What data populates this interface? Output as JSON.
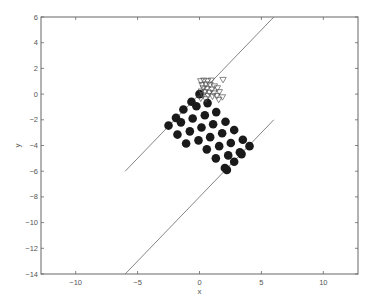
{
  "chart_data": {
    "type": "scatter",
    "title": "",
    "xlabel": "x",
    "ylabel": "y",
    "xlim": [
      -12.8,
      12.8
    ],
    "ylim": [
      -14,
      6
    ],
    "xticks": [
      -10,
      -5,
      0,
      5,
      10
    ],
    "xtick_labels": [
      "−10",
      "−5",
      "0",
      "5",
      "10"
    ],
    "yticks": [
      6,
      4,
      2,
      0,
      -2,
      -4,
      -6,
      -8,
      -10,
      -12,
      -14
    ],
    "ytick_labels": [
      "6",
      "4",
      "2",
      "0",
      "−2",
      "−4",
      "−6",
      "−8",
      "−10",
      "−12",
      "−14"
    ],
    "grid": false,
    "legend": null,
    "series": [
      {
        "name": "filled circles",
        "marker": "circle-filled",
        "color": "#1a1a1a",
        "points": [
          [
            0.0,
            0.0
          ],
          [
            -0.65,
            -0.6
          ],
          [
            -0.25,
            -0.95
          ],
          [
            0.65,
            -0.7
          ],
          [
            -1.3,
            -1.2
          ],
          [
            1.35,
            -1.4
          ],
          [
            -1.9,
            -1.85
          ],
          [
            -1.5,
            -2.2
          ],
          [
            -0.55,
            -1.9
          ],
          [
            0.43,
            -1.65
          ],
          [
            -2.5,
            -2.45
          ],
          [
            -1.78,
            -3.15
          ],
          [
            -0.78,
            -2.9
          ],
          [
            0.16,
            -2.6
          ],
          [
            1.1,
            -2.35
          ],
          [
            2.1,
            -2.15
          ],
          [
            -1.08,
            -3.85
          ],
          [
            -0.08,
            -3.6
          ],
          [
            0.86,
            -3.35
          ],
          [
            1.83,
            -3.05
          ],
          [
            2.8,
            -2.8
          ],
          [
            0.59,
            -4.3
          ],
          [
            1.59,
            -4.05
          ],
          [
            2.53,
            -3.8
          ],
          [
            3.5,
            -3.55
          ],
          [
            1.32,
            -5.0
          ],
          [
            2.32,
            -4.77
          ],
          [
            3.26,
            -4.52
          ],
          [
            4.04,
            -4.05
          ],
          [
            2.05,
            -5.75
          ],
          [
            2.8,
            -5.27
          ],
          [
            3.4,
            -4.67
          ],
          [
            2.21,
            -5.9
          ]
        ]
      },
      {
        "name": "open triangles",
        "marker": "triangle-open",
        "color": "#555555",
        "points": [
          [
            0.1,
            1.0
          ],
          [
            0.35,
            1.05
          ],
          [
            0.65,
            1.0
          ],
          [
            0.95,
            1.05
          ],
          [
            1.9,
            1.1
          ],
          [
            0.2,
            0.7
          ],
          [
            0.5,
            0.75
          ],
          [
            0.85,
            0.7
          ],
          [
            1.2,
            0.6
          ],
          [
            0.3,
            0.45
          ],
          [
            0.6,
            0.4
          ],
          [
            1.0,
            0.35
          ],
          [
            1.45,
            0.45
          ],
          [
            0.15,
            0.2
          ],
          [
            0.45,
            0.15
          ],
          [
            0.8,
            0.1
          ],
          [
            1.15,
            0.05
          ],
          [
            1.6,
            0.15
          ],
          [
            0.3,
            -0.1
          ],
          [
            0.7,
            -0.15
          ],
          [
            1.05,
            -0.2
          ],
          [
            1.4,
            -0.15
          ],
          [
            1.85,
            -0.25
          ],
          [
            0.1,
            -0.35
          ],
          [
            0.5,
            -0.4
          ],
          [
            1.55,
            -0.45
          ]
        ]
      }
    ],
    "lines": [
      {
        "name": "upper boundary",
        "from": [
          -6,
          -6
        ],
        "to": [
          6,
          6
        ],
        "color": "#777777"
      },
      {
        "name": "lower boundary",
        "from": [
          -6,
          -14
        ],
        "to": [
          6,
          -2
        ],
        "color": "#777777"
      }
    ]
  }
}
